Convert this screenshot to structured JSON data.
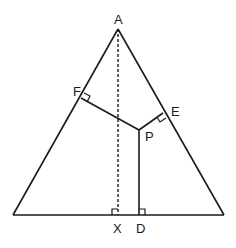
{
  "diagram": {
    "type": "geometry-triangle",
    "labels": {
      "A": "A",
      "F": "F",
      "E": "E",
      "P": "P",
      "X": "X",
      "D": "D"
    },
    "points": {
      "A": [
        118,
        29
      ],
      "B": [
        13,
        215
      ],
      "C": [
        224,
        215
      ],
      "F": [
        81,
        98
      ],
      "E": [
        163,
        113
      ],
      "P": [
        139,
        130
      ],
      "X": [
        118,
        215
      ],
      "D": [
        139,
        215
      ]
    },
    "segments": [
      {
        "from": "A",
        "to": "B",
        "style": "solid"
      },
      {
        "from": "A",
        "to": "C",
        "style": "solid"
      },
      {
        "from": "B",
        "to": "C",
        "style": "solid"
      },
      {
        "from": "A",
        "to": "X",
        "style": "dashed"
      },
      {
        "from": "P",
        "to": "F",
        "style": "solid"
      },
      {
        "from": "P",
        "to": "E",
        "style": "solid"
      },
      {
        "from": "P",
        "to": "D",
        "style": "solid"
      }
    ],
    "right_angles": [
      "F",
      "E",
      "X",
      "D"
    ],
    "stroke_color": "#1a1a1a"
  }
}
